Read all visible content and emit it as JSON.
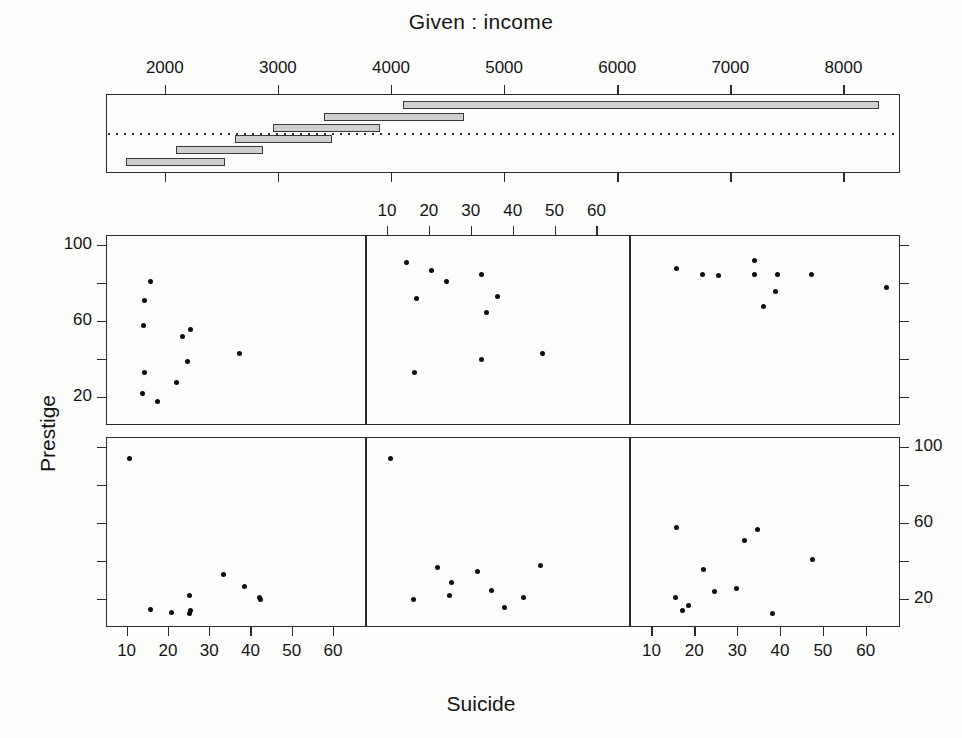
{
  "figure": {
    "given_title": "Given :  income",
    "x_axis_title": "Suicide",
    "y_axis_title": "Prestige"
  },
  "given_axis": {
    "labels": [
      "2000",
      "3000",
      "4000",
      "5000",
      "6000",
      "7000",
      "8000"
    ],
    "values": [
      2000,
      3000,
      4000,
      5000,
      6000,
      7000,
      8000
    ]
  },
  "x_axis": {
    "labels": [
      "10",
      "20",
      "30",
      "40",
      "50",
      "60"
    ],
    "values": [
      10,
      20,
      30,
      40,
      50,
      60
    ]
  },
  "y_axis": {
    "labels": [
      "20",
      "60",
      "100"
    ],
    "values": [
      20,
      60,
      100
    ]
  },
  "chart_data": {
    "type": "scatter",
    "title": "Given :  income",
    "xlabel": "Suicide",
    "ylabel": "Prestige",
    "xlim": [
      5,
      68
    ],
    "ylim": [
      5,
      105
    ],
    "grid": false,
    "legend": "none",
    "conditioning_variable": "income",
    "conditioning_intervals": [
      {
        "index": 1,
        "row": 2,
        "col": 1,
        "min": 1656,
        "max": 2536,
        "label": "1656 - 2536"
      },
      {
        "index": 2,
        "row": 2,
        "col": 2,
        "min": 2100,
        "max": 2865,
        "label": "2100 - 2865"
      },
      {
        "index": 3,
        "row": 2,
        "col": 3,
        "min": 2620,
        "max": 3475,
        "label": "2620 - 3475"
      },
      {
        "index": 4,
        "row": 1,
        "col": 1,
        "min": 2954,
        "max": 3907,
        "label": "2954 - 3907"
      },
      {
        "index": 5,
        "row": 1,
        "col": 2,
        "min": 3403,
        "max": 4648,
        "label": "3403 - 4648"
      },
      {
        "index": 6,
        "row": 1,
        "col": 3,
        "min": 4110,
        "max": 8312,
        "label": "4110 - 8312"
      }
    ],
    "panels": [
      {
        "name": "top-left",
        "row": 1,
        "col": 1,
        "interval_index": 4,
        "points": [
          {
            "x": 15.6,
            "y": 81.0
          },
          {
            "x": 14.2,
            "y": 71.0
          },
          {
            "x": 13.9,
            "y": 58.0
          },
          {
            "x": 25.2,
            "y": 56.0
          },
          {
            "x": 23.3,
            "y": 52.0
          },
          {
            "x": 37.0,
            "y": 43.0
          },
          {
            "x": 24.4,
            "y": 39.0
          },
          {
            "x": 14.0,
            "y": 33.0
          },
          {
            "x": 21.8,
            "y": 28.0
          },
          {
            "x": 13.6,
            "y": 22.0
          },
          {
            "x": 17.3,
            "y": 18.0
          }
        ]
      },
      {
        "name": "top-middle",
        "row": 1,
        "col": 2,
        "interval_index": 5,
        "points": [
          {
            "x": 14.4,
            "y": 91.0
          },
          {
            "x": 20.5,
            "y": 87.0
          },
          {
            "x": 32.4,
            "y": 85.0
          },
          {
            "x": 24.0,
            "y": 81.0
          },
          {
            "x": 16.8,
            "y": 72.0
          },
          {
            "x": 36.2,
            "y": 73.0
          },
          {
            "x": 33.5,
            "y": 65.0
          },
          {
            "x": 46.8,
            "y": 43.0
          },
          {
            "x": 32.3,
            "y": 40.0
          },
          {
            "x": 16.3,
            "y": 33.0
          }
        ]
      },
      {
        "name": "top-right",
        "row": 1,
        "col": 3,
        "interval_index": 6,
        "points": [
          {
            "x": 33.8,
            "y": 92.0
          },
          {
            "x": 15.7,
            "y": 88.0
          },
          {
            "x": 21.7,
            "y": 85.0
          },
          {
            "x": 25.3,
            "y": 84.0
          },
          {
            "x": 33.8,
            "y": 85.0
          },
          {
            "x": 39.2,
            "y": 85.0
          },
          {
            "x": 47.2,
            "y": 85.0
          },
          {
            "x": 38.8,
            "y": 76.0
          },
          {
            "x": 64.5,
            "y": 78.0
          },
          {
            "x": 36.0,
            "y": 68.0
          }
        ]
      },
      {
        "name": "bottom-left",
        "row": 2,
        "col": 1,
        "interval_index": 1,
        "points": [
          {
            "x": 10.4,
            "y": 94.0
          },
          {
            "x": 33.3,
            "y": 33.0
          },
          {
            "x": 38.3,
            "y": 27.0
          },
          {
            "x": 25.0,
            "y": 22.0
          },
          {
            "x": 41.9,
            "y": 21.0
          },
          {
            "x": 42.1,
            "y": 20.0
          },
          {
            "x": 15.5,
            "y": 15.0
          },
          {
            "x": 25.3,
            "y": 14.0
          },
          {
            "x": 20.6,
            "y": 13.0
          },
          {
            "x": 24.9,
            "y": 12.5
          }
        ]
      },
      {
        "name": "bottom-middle",
        "row": 2,
        "col": 2,
        "interval_index": 2,
        "points": [
          {
            "x": 10.5,
            "y": 94.0
          },
          {
            "x": 46.5,
            "y": 38.0
          },
          {
            "x": 31.3,
            "y": 35.0
          },
          {
            "x": 21.9,
            "y": 37.0
          },
          {
            "x": 25.1,
            "y": 29.0
          },
          {
            "x": 34.8,
            "y": 25.0
          },
          {
            "x": 24.6,
            "y": 22.0
          },
          {
            "x": 42.4,
            "y": 21.0
          },
          {
            "x": 16.1,
            "y": 20.0
          },
          {
            "x": 37.9,
            "y": 16.0
          }
        ]
      },
      {
        "name": "bottom-right",
        "row": 2,
        "col": 3,
        "interval_index": 3,
        "points": [
          {
            "x": 15.6,
            "y": 58.0
          },
          {
            "x": 34.5,
            "y": 57.0
          },
          {
            "x": 31.5,
            "y": 51.0
          },
          {
            "x": 47.3,
            "y": 41.0
          },
          {
            "x": 21.9,
            "y": 36.0
          },
          {
            "x": 29.6,
            "y": 26.0
          },
          {
            "x": 24.5,
            "y": 24.0
          },
          {
            "x": 15.3,
            "y": 21.0
          },
          {
            "x": 18.4,
            "y": 17.0
          },
          {
            "x": 17.0,
            "y": 14.0
          },
          {
            "x": 38.0,
            "y": 12.5
          }
        ]
      }
    ]
  }
}
